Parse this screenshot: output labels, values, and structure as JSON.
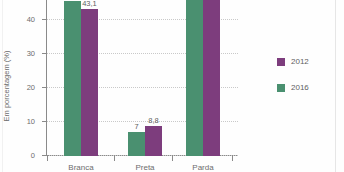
{
  "chart_data": {
    "type": "bar",
    "title": "",
    "xlabel": "",
    "ylabel": "Em porcentagem (%)",
    "ylim": [
      0,
      50
    ],
    "yticks": [
      "0",
      "10",
      "20",
      "30",
      "40"
    ],
    "ytick_values": [
      0,
      10,
      20,
      30,
      40
    ],
    "grid": true,
    "legend_position": "right",
    "categories": [
      "Branca",
      "Preta",
      "Parda"
    ],
    "series": [
      {
        "name": "2012",
        "color": "#7d3d7d",
        "values": [
          43.1,
          8.8,
          47.1
        ],
        "labels": [
          "43,1",
          "8,8",
          "47,1"
        ]
      },
      {
        "name": "2016",
        "color": "#4a9070",
        "values": [
          45.7,
          7.0,
          46.8
        ],
        "labels": [
          "45,7",
          "7",
          "46,8"
        ]
      }
    ]
  },
  "legend": {
    "items": [
      {
        "label": "2012",
        "color": "#7d3d7d"
      },
      {
        "label": "2016",
        "color": "#4a9070"
      }
    ]
  }
}
